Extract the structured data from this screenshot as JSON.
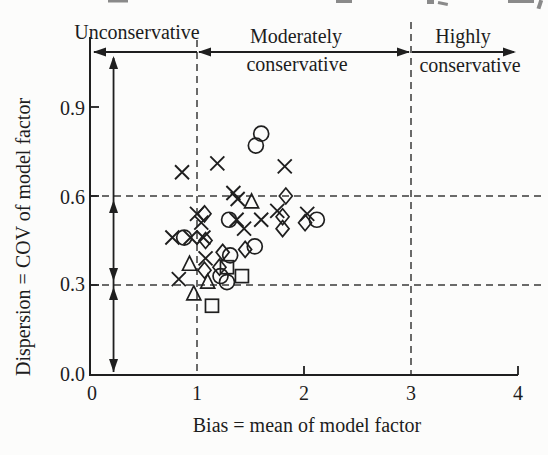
{
  "figure": {
    "background": "#fcfcfb",
    "ink_color": "#1f1f1f",
    "dash_color": "#3a3a3a"
  },
  "regions": {
    "list": [
      {
        "label": "Unconservative",
        "x_range": [
          0,
          1
        ]
      },
      {
        "label": "Moderately conservative",
        "x_range": [
          1,
          3
        ]
      },
      {
        "label": "Highly conservative",
        "x_range": [
          3,
          4
        ]
      }
    ],
    "unconservative": "Unconservative",
    "moderately_line1": "Moderately",
    "moderately_line2": "conservative",
    "highly_line1": "Highly",
    "highly_line2": "conservative"
  },
  "chart_data": {
    "type": "scatter",
    "title": "",
    "xlabel": "Bias = mean of model factor",
    "ylabel": "Dispersion = COV of model factor",
    "xlim": [
      0,
      4
    ],
    "ylim": [
      0.0,
      1.0
    ],
    "xticks": [
      0,
      1,
      2,
      3,
      4
    ],
    "yticks": [
      0.0,
      0.3,
      0.6,
      0.9
    ],
    "xtick_labels": [
      "0",
      "1",
      "2",
      "3",
      "4"
    ],
    "ytick_labels": [
      "0.0",
      "0.3",
      "0.6",
      "0.9"
    ],
    "grid": {
      "vertical_dashed_x": [
        1,
        3
      ],
      "horizontal_dashed_y": [
        0.6,
        0.3
      ]
    },
    "legend": "none",
    "series": [
      {
        "name": "cross",
        "marker": "x",
        "points": [
          [
            0.86,
            0.68
          ],
          [
            1.19,
            0.71
          ],
          [
            1.82,
            0.7
          ],
          [
            1.34,
            0.61
          ],
          [
            1.38,
            0.59
          ],
          [
            1.0,
            0.54
          ],
          [
            1.04,
            0.51
          ],
          [
            1.37,
            0.52
          ],
          [
            0.77,
            0.46
          ],
          [
            0.94,
            0.46
          ],
          [
            1.06,
            0.46
          ],
          [
            1.08,
            0.39
          ],
          [
            0.83,
            0.32
          ],
          [
            1.44,
            0.49
          ],
          [
            1.6,
            0.52
          ],
          [
            1.75,
            0.55
          ],
          [
            2.03,
            0.54
          ]
        ]
      },
      {
        "name": "circle",
        "marker": "o",
        "points": [
          [
            1.55,
            0.77
          ],
          [
            1.6,
            0.81
          ],
          [
            0.88,
            0.46
          ],
          [
            1.3,
            0.52
          ],
          [
            1.22,
            0.33
          ],
          [
            1.28,
            0.31
          ],
          [
            1.31,
            0.4
          ],
          [
            1.54,
            0.43
          ],
          [
            2.12,
            0.52
          ]
        ]
      },
      {
        "name": "triangle",
        "marker": "^",
        "points": [
          [
            1.51,
            0.58
          ],
          [
            0.93,
            0.37
          ],
          [
            1.1,
            0.31
          ],
          [
            0.97,
            0.27
          ]
        ]
      },
      {
        "name": "square",
        "marker": "s",
        "points": [
          [
            1.28,
            0.36
          ],
          [
            1.42,
            0.33
          ],
          [
            1.14,
            0.23
          ]
        ]
      },
      {
        "name": "diamond",
        "marker": "d",
        "points": [
          [
            1.83,
            0.6
          ],
          [
            1.8,
            0.53
          ],
          [
            1.8,
            0.49
          ],
          [
            2.01,
            0.51
          ],
          [
            1.07,
            0.54
          ],
          [
            1.08,
            0.45
          ],
          [
            1.07,
            0.35
          ],
          [
            1.21,
            0.36
          ],
          [
            1.24,
            0.41
          ],
          [
            1.45,
            0.42
          ]
        ]
      }
    ],
    "annotations": {
      "vertical_double_arrows_at_x": 0.22,
      "vertical_arrow_segments_cov": [
        [
          0.6,
          1.08
        ],
        [
          0.3,
          0.6
        ],
        [
          0.0,
          0.3
        ]
      ],
      "top_arrow_y_px": 52
    }
  }
}
